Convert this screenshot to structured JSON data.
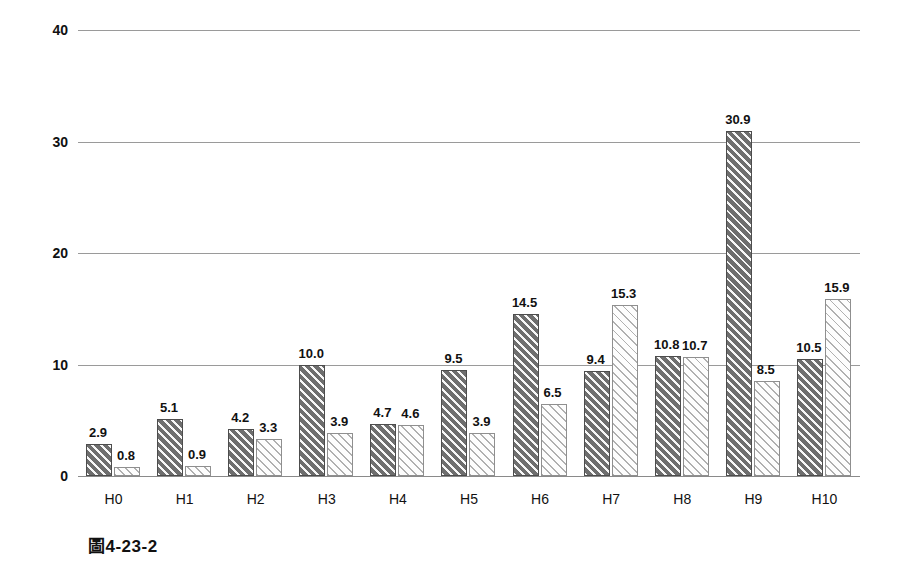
{
  "caption": "圖4-23-2",
  "colors": {
    "series_dark": "#6e6e6e",
    "series_light": "#fdfdfd",
    "gridline": "#9a9a9a",
    "text": "#111111",
    "background": "#ffffff"
  },
  "chart_data": {
    "type": "bar",
    "title": "",
    "subtitle": "",
    "xlabel": "",
    "ylabel": "",
    "ylim": [
      0,
      40
    ],
    "yticks": [
      "0",
      "10",
      "20",
      "30",
      "40"
    ],
    "ytick_values": [
      0,
      10,
      20,
      30,
      40
    ],
    "grid": true,
    "legend": "none",
    "categories": [
      "H0",
      "H1",
      "H2",
      "H3",
      "H4",
      "H5",
      "H6",
      "H7",
      "H8",
      "H9",
      "H10"
    ],
    "series": [
      {
        "name": "series-1-dark-hatch",
        "values": [
          2.9,
          5.1,
          4.2,
          10.0,
          4.7,
          9.5,
          14.5,
          9.4,
          10.8,
          30.9,
          10.5
        ],
        "labels": [
          "2.9",
          "5.1",
          "4.2",
          "10.0",
          "4.7",
          "9.5",
          "14.5",
          "9.4",
          "10.8",
          "30.9",
          "10.5"
        ]
      },
      {
        "name": "series-2-light-hatch",
        "values": [
          0.8,
          0.9,
          3.3,
          3.9,
          4.6,
          3.9,
          6.5,
          15.3,
          10.7,
          8.5,
          15.9
        ],
        "labels": [
          "0.8",
          "0.9",
          "3.3",
          "3.9",
          "4.6",
          "3.9",
          "6.5",
          "15.3",
          "10.7",
          "8.5",
          "15.9"
        ]
      }
    ]
  }
}
